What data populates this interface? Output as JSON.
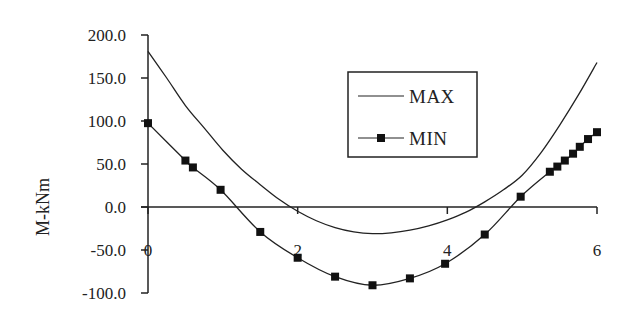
{
  "chart_data": {
    "type": "line",
    "title": "",
    "xlabel": "",
    "ylabel": "M-kNm",
    "xlim": [
      0,
      6
    ],
    "ylim": [
      -100,
      200
    ],
    "grid": false,
    "legend_position": "upper-center-right (inside plot)",
    "x_ticks": [
      "0",
      "2",
      "4",
      "6"
    ],
    "y_ticks": [
      "200.0",
      "150.0",
      "100.0",
      "50.0",
      "0.0",
      "-50.0",
      "-100.0"
    ],
    "series": [
      {
        "name": "MAX",
        "marker": "none",
        "x": [
          0,
          0.25,
          0.5,
          0.75,
          1.0,
          1.25,
          1.5,
          1.75,
          2.0,
          2.25,
          2.5,
          2.75,
          3.0,
          3.25,
          3.5,
          3.75,
          4.0,
          4.25,
          4.5,
          4.75,
          5.0,
          5.25,
          5.5,
          5.75,
          6.0
        ],
        "values": [
          181,
          150,
          118,
          92,
          66,
          44,
          26,
          9,
          -5,
          -16,
          -24,
          -29,
          -31,
          -30,
          -27,
          -22,
          -15,
          -6,
          6,
          20,
          37,
          63,
          95,
          130,
          168
        ]
      },
      {
        "name": "MIN",
        "marker": "square",
        "x": [
          0,
          0.5,
          0.6,
          0.97,
          1.5,
          2.0,
          2.5,
          3.0,
          3.5,
          3.97,
          4.5,
          4.98,
          5.37,
          5.47,
          5.57,
          5.68,
          5.77,
          5.88,
          6.0
        ],
        "values": [
          97.5,
          54,
          46,
          20,
          -29,
          -59,
          -81,
          -91,
          -83,
          -66,
          -32,
          12,
          41,
          47,
          54,
          62,
          70,
          79,
          87
        ]
      }
    ]
  },
  "legend": {
    "items": [
      {
        "label": "MAX"
      },
      {
        "label": "MIN"
      }
    ]
  },
  "axes": {
    "ylabel": "M-kNm",
    "x_ticks": [
      "0",
      "2",
      "4",
      "6"
    ],
    "y_ticks": [
      "200.0",
      "150.0",
      "100.0",
      "50.0",
      "0.0",
      "-50.0",
      "-100.0"
    ]
  }
}
